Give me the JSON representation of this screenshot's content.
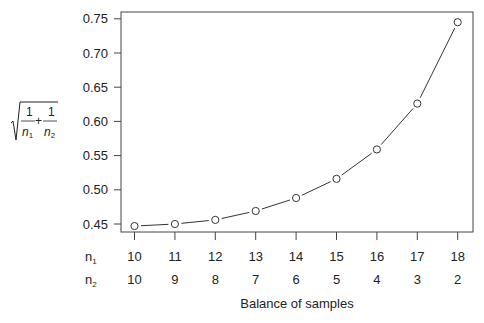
{
  "chart_data": {
    "type": "line",
    "title": "",
    "xlabel": "Balance of samples",
    "ylabel": "sqrt(1/n1 + 1/n2)",
    "ylabel_parts": {
      "num1": "1",
      "den1": "n",
      "sub1": "1",
      "plus": "+",
      "num2": "1",
      "den2": "n",
      "sub2": "2"
    },
    "row_labels": [
      {
        "base": "n",
        "sub": "1"
      },
      {
        "base": "n",
        "sub": "2"
      }
    ],
    "n1": [
      "10",
      "11",
      "12",
      "13",
      "14",
      "15",
      "16",
      "17",
      "18"
    ],
    "n2": [
      "10",
      "9",
      "8",
      "7",
      "6",
      "5",
      "4",
      "3",
      "2"
    ],
    "x": [
      0,
      1,
      2,
      3,
      4,
      5,
      6,
      7,
      8
    ],
    "series": [
      {
        "name": "sqrt(1/n1+1/n2)",
        "values": [
          0.447,
          0.45,
          0.456,
          0.469,
          0.488,
          0.516,
          0.559,
          0.626,
          0.745
        ],
        "marker": "open-circle",
        "line": "solid"
      }
    ],
    "yticks": [
      "0.45",
      "0.50",
      "0.55",
      "0.60",
      "0.65",
      "0.70",
      "0.75"
    ],
    "ytick_values": [
      0.45,
      0.5,
      0.55,
      0.6,
      0.65,
      0.7,
      0.75
    ],
    "ylim": [
      0.438,
      0.76
    ],
    "grid": false,
    "legend": "none"
  },
  "colors": {
    "ink": "#222222",
    "axis": "#444444",
    "background": "#ffffff"
  }
}
